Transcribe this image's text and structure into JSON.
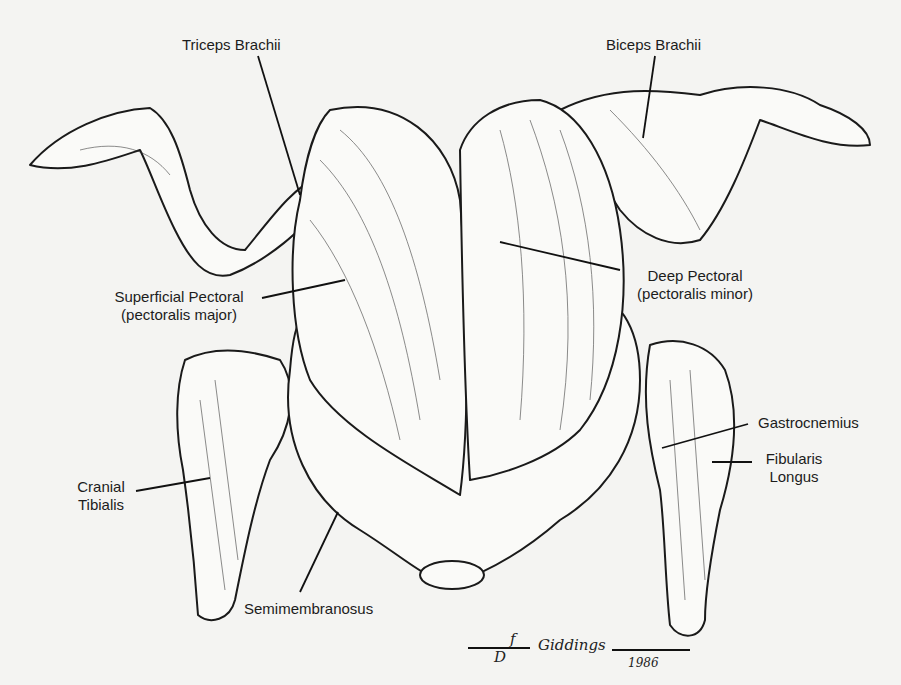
{
  "labels": {
    "triceps": "Triceps Brachii",
    "biceps": "Biceps Brachii",
    "superficial_pectoral": "Superficial Pectoral",
    "superficial_pectoral_alt": "(pectoralis major)",
    "deep_pectoral": "Deep Pectoral",
    "deep_pectoral_alt": "(pectoralis minor)",
    "gastrocnemius": "Gastrocnemius",
    "fibularis_1": "Fibularis",
    "fibularis_2": "Longus",
    "cranial_1": "Cranial",
    "cranial_2": "Tibialis",
    "semimembranosus": "Semimembranosus"
  },
  "signature": {
    "initials_top": "f",
    "initials_bottom": "D",
    "name": "Giddings",
    "year": "1986"
  }
}
